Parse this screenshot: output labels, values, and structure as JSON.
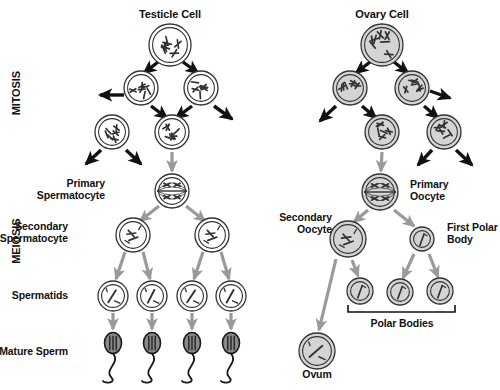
{
  "diagram": {
    "title_text": "Gametogenesis",
    "colors": {
      "dark_arrow": "#111111",
      "gray_arrow": "#9a9a9a",
      "cell_outline": "#333333",
      "male_cell_fill": "#ffffff",
      "female_cell_fill": "#d4d4d4",
      "sperm_head_fill": "#8a8a8a",
      "text": "#111111"
    },
    "stage_labels": [
      {
        "name": "mitosis",
        "text": "MITOSIS",
        "x": 16,
        "y": 95,
        "size": 11
      },
      {
        "name": "meiosis",
        "text": "MEIOSIS",
        "x": 16,
        "y": 243,
        "size": 11
      }
    ],
    "male_branch": {
      "heading": {
        "text": "Testicle Cell",
        "x": 170,
        "y": 15,
        "size": 11
      },
      "labels": [
        {
          "name": "primary-spermatocyte",
          "lines": [
            "Primary",
            "Spermatocyte"
          ],
          "x": 105,
          "y": 190,
          "size": 10.5,
          "align": "right"
        },
        {
          "name": "secondary-spermatocyte",
          "lines": [
            "Secondary",
            "Spermatocyte"
          ],
          "x": 68,
          "y": 233,
          "size": 10.5,
          "align": "right"
        },
        {
          "name": "spermatids",
          "lines": [
            "Spermatids"
          ],
          "x": 68,
          "y": 296,
          "size": 10.5,
          "align": "right"
        },
        {
          "name": "mature-sperm",
          "lines": [
            "Mature Sperm"
          ],
          "x": 68,
          "y": 352,
          "size": 10.5,
          "align": "right"
        }
      ],
      "cells": [
        {
          "name": "testicle-cell",
          "cx": 170,
          "cy": 45,
          "r": 21,
          "type": "mitotic"
        },
        {
          "name": "mitosis-cell-l1",
          "cx": 141,
          "cy": 88,
          "r": 17,
          "type": "mitotic"
        },
        {
          "name": "mitosis-cell-r1",
          "cx": 201,
          "cy": 88,
          "r": 17,
          "type": "mitotic"
        },
        {
          "name": "mitosis-cell-l2",
          "cx": 112,
          "cy": 132,
          "r": 17,
          "type": "mitotic"
        },
        {
          "name": "mitosis-cell-r2",
          "cx": 172,
          "cy": 132,
          "r": 17,
          "type": "mitotic"
        },
        {
          "name": "primary-spermatocyte-cell",
          "cx": 172,
          "cy": 191,
          "r": 17,
          "type": "tetrad"
        },
        {
          "name": "secondary-spermatocyte-cell-left",
          "cx": 133,
          "cy": 235,
          "r": 17,
          "type": "dyad"
        },
        {
          "name": "secondary-spermatocyte-cell-right",
          "cx": 212,
          "cy": 235,
          "r": 17,
          "type": "dyad"
        },
        {
          "name": "spermatid-cell-1",
          "cx": 113,
          "cy": 296,
          "r": 15,
          "type": "haploid"
        },
        {
          "name": "spermatid-cell-2",
          "cx": 152,
          "cy": 296,
          "r": 15,
          "type": "haploid"
        },
        {
          "name": "spermatid-cell-3",
          "cx": 192,
          "cy": 296,
          "r": 15,
          "type": "haploid"
        },
        {
          "name": "spermatid-cell-4",
          "cx": 231,
          "cy": 296,
          "r": 15,
          "type": "haploid"
        }
      ],
      "sperm": [
        {
          "name": "mature-sperm-1",
          "cx": 113,
          "cy": 343
        },
        {
          "name": "mature-sperm-2",
          "cx": 152,
          "cy": 343
        },
        {
          "name": "mature-sperm-3",
          "cx": 192,
          "cy": 343
        },
        {
          "name": "mature-sperm-4",
          "cx": 231,
          "cy": 343
        }
      ]
    },
    "female_branch": {
      "heading": {
        "text": "Ovary Cell",
        "x": 382,
        "y": 15,
        "size": 11
      },
      "labels": [
        {
          "name": "primary-oocyte",
          "lines": [
            "Primary",
            "Oocyte"
          ],
          "x": 410,
          "y": 191,
          "size": 10.5,
          "align": "left"
        },
        {
          "name": "secondary-oocyte",
          "lines": [
            "Secondary",
            "Oocyte"
          ],
          "x": 332,
          "y": 224,
          "size": 10.5,
          "align": "right"
        },
        {
          "name": "first-polar-body",
          "lines": [
            "First Polar",
            "Body"
          ],
          "x": 447,
          "y": 234,
          "size": 10.5,
          "align": "left"
        },
        {
          "name": "polar-bodies",
          "lines": [
            "Polar Bodies"
          ],
          "x": 402,
          "y": 324,
          "size": 10.5,
          "align": "center"
        },
        {
          "name": "ovum",
          "lines": [
            "Ovum"
          ],
          "x": 317,
          "y": 375,
          "size": 10.5,
          "align": "center"
        }
      ],
      "cells": [
        {
          "name": "ovary-cell",
          "cx": 382,
          "cy": 45,
          "r": 21,
          "type": "mitotic"
        },
        {
          "name": "ovary-mitosis-cell-l1",
          "cx": 350,
          "cy": 88,
          "r": 17,
          "type": "mitotic"
        },
        {
          "name": "ovary-mitosis-cell-r1",
          "cx": 412,
          "cy": 88,
          "r": 17,
          "type": "mitotic"
        },
        {
          "name": "ovary-mitosis-cell-l2",
          "cx": 382,
          "cy": 132,
          "r": 17,
          "type": "mitotic"
        },
        {
          "name": "ovary-mitosis-cell-r2",
          "cx": 444,
          "cy": 132,
          "r": 17,
          "type": "mitotic"
        },
        {
          "name": "primary-oocyte-cell",
          "cx": 380,
          "cy": 192,
          "r": 18,
          "type": "tetrad"
        },
        {
          "name": "secondary-oocyte-cell",
          "cx": 348,
          "cy": 239,
          "r": 18,
          "type": "dyad"
        },
        {
          "name": "first-polar-body-cell",
          "cx": 422,
          "cy": 239,
          "r": 12,
          "type": "small"
        },
        {
          "name": "polar-body-cell-1",
          "cx": 360,
          "cy": 291,
          "r": 13,
          "type": "small"
        },
        {
          "name": "polar-body-cell-2",
          "cx": 400,
          "cy": 292,
          "r": 13,
          "type": "small"
        },
        {
          "name": "polar-body-cell-3",
          "cx": 440,
          "cy": 291,
          "r": 13,
          "type": "small"
        },
        {
          "name": "ovum-cell",
          "cx": 317,
          "cy": 351,
          "r": 18,
          "type": "haploid"
        }
      ],
      "bracket": {
        "name": "polar-bodies-bracket",
        "x1": 348,
        "x2": 455,
        "y": 312,
        "tick": 7
      }
    }
  }
}
